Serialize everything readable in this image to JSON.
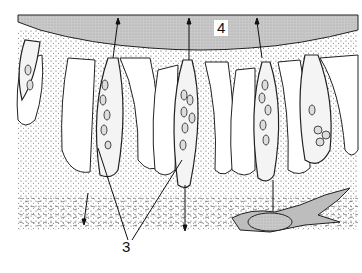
{
  "diagram": {
    "type": "biological-illustration",
    "labels": [
      {
        "id": "4",
        "text": "4",
        "target": "lumen/surface layer (stippled grey band at top)"
      },
      {
        "id": "3",
        "text": "3",
        "target": "columnar cells with nuclei (two leader lines)"
      }
    ],
    "colors": {
      "lumen": "#c9c9c9",
      "stipple": "#555555",
      "outline": "#222222",
      "background": "#ffffff",
      "cell_fill": "#ffffff",
      "pigment_cell": "#bdbdbd"
    }
  }
}
